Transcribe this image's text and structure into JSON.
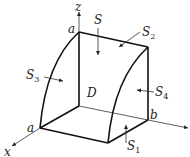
{
  "diagram": {
    "type": "3d-region-surfaces",
    "axes": {
      "x": "x",
      "y": "",
      "z": "z"
    },
    "points": {
      "a_top": "a",
      "a_left": "a",
      "b": "b"
    },
    "region_label": "D",
    "surfaces": [
      {
        "id": "S",
        "label": "S",
        "sub": ""
      },
      {
        "id": "S1",
        "label": "S",
        "sub": "1"
      },
      {
        "id": "S2",
        "label": "S",
        "sub": "2"
      },
      {
        "id": "S3",
        "label": "S",
        "sub": "3"
      },
      {
        "id": "S4",
        "label": "S",
        "sub": "4"
      }
    ],
    "colors": {
      "stroke": "#111111",
      "background": "#ffffff"
    }
  }
}
